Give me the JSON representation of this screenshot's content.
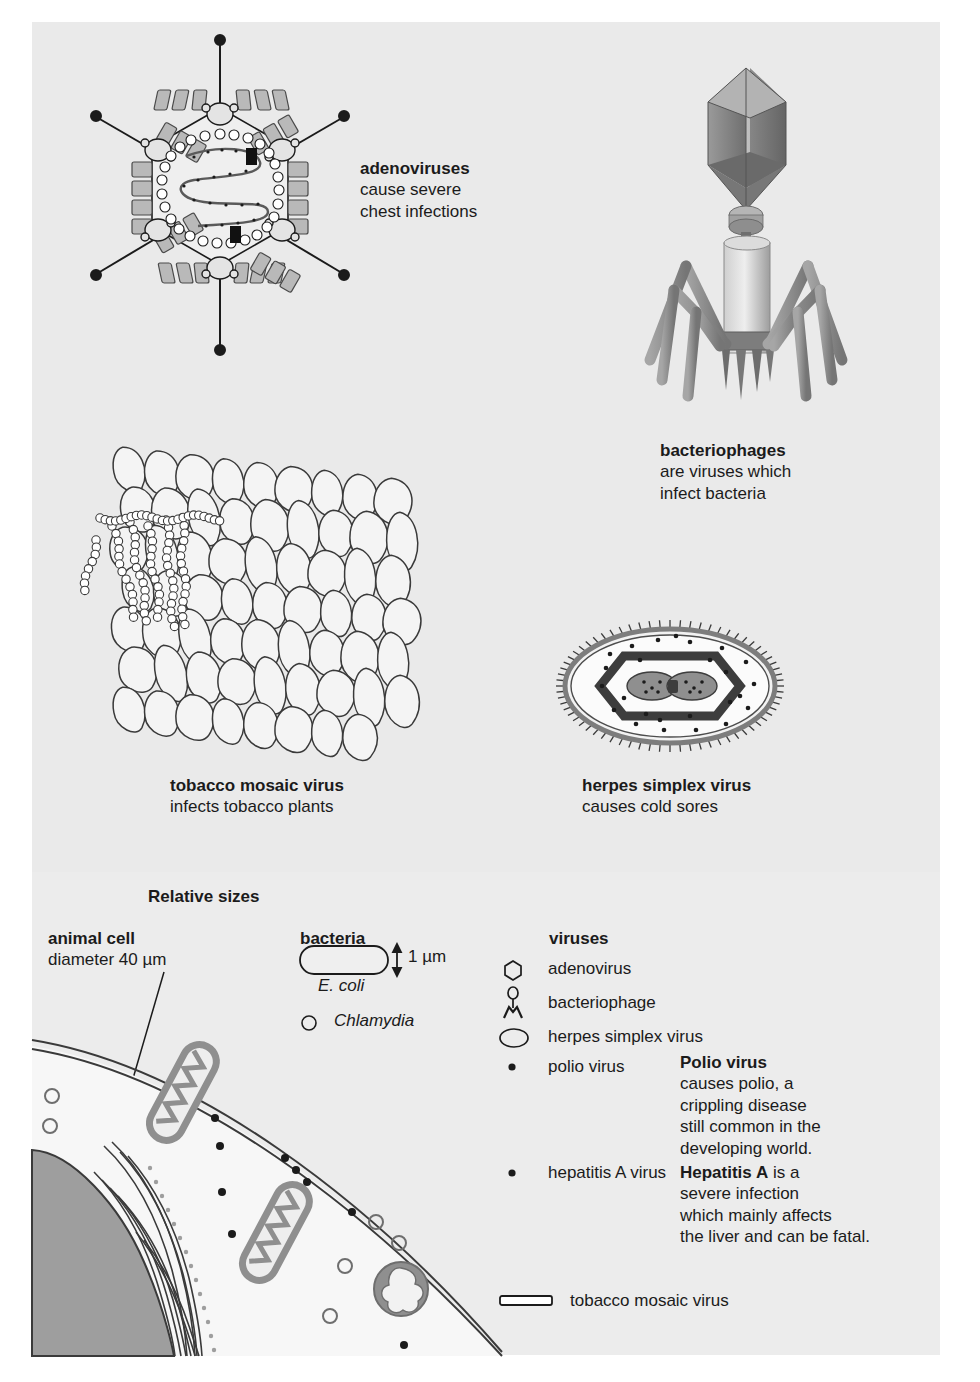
{
  "figure": {
    "background_color": "#eaeaea",
    "lower_panel_color": "#ececec",
    "ink_color": "#1b1b1b",
    "capsomere_fill": "#b9b9b9",
    "phage_gray": "#8e8e8e",
    "nucleus_gray": "#9e9e9e",
    "organelle_gray": "#8f8f8f"
  },
  "specimens": [
    {
      "id": "adenovirus",
      "icon": "adenovirus-icon",
      "title": "adenoviruses",
      "description_lines": [
        "cause severe",
        "chest infections"
      ]
    },
    {
      "id": "bacteriophage",
      "icon": "bacteriophage-icon",
      "title": "bacteriophages",
      "description_lines": [
        "are viruses which",
        "infect bacteria"
      ]
    },
    {
      "id": "tobacco-mosaic-virus",
      "icon": "tobacco-mosaic-virus-icon",
      "title": "tobacco mosaic virus",
      "description_lines": [
        "infects tobacco plants"
      ]
    },
    {
      "id": "herpes-simplex-virus",
      "icon": "herpes-simplex-virus-icon",
      "title": "herpes simplex virus",
      "description_lines": [
        "causes cold sores"
      ]
    }
  ],
  "relative_sizes": {
    "heading": "Relative sizes",
    "columns": {
      "animal_cell": {
        "heading": "animal cell",
        "subtitle": "diameter 40 µm"
      },
      "bacteria": {
        "heading": "bacteria",
        "scale_label": "1 µm",
        "items": [
          {
            "label": "E. coli",
            "italic": true,
            "icon": "capsule-rod-icon"
          },
          {
            "label": "Chlamydia",
            "italic": true,
            "icon": "small-circle-icon"
          }
        ]
      },
      "viruses": {
        "heading": "viruses",
        "items": [
          {
            "label": "adenovirus",
            "icon": "hexagon-icon"
          },
          {
            "label": "bacteriophage",
            "icon": "phage-glyph-icon"
          },
          {
            "label": "herpes simplex virus",
            "icon": "ellipse-icon"
          },
          {
            "label": "polio virus",
            "icon": "dot-icon"
          },
          {
            "label": "hepatitis A virus",
            "icon": "dot-icon"
          },
          {
            "label": "tobacco mosaic virus",
            "icon": "rod-icon"
          }
        ]
      }
    },
    "notes": [
      {
        "id": "polio-note",
        "title": "Polio virus",
        "lines": [
          "causes polio, a",
          "crippling disease",
          "still common in the",
          "developing world."
        ]
      },
      {
        "id": "hepatitis-note",
        "title": "Hepatitis A",
        "first_line_rest": " is a",
        "lines": [
          "severe infection",
          "which mainly affects",
          "the liver and can be fatal."
        ]
      }
    ]
  }
}
